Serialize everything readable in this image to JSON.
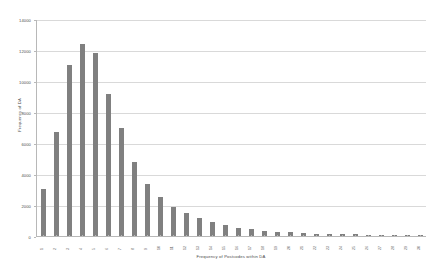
{
  "chart_data": {
    "type": "bar",
    "title": "",
    "xlabel": "Frequency of Postcodes within DA",
    "ylabel": "Frequency of DA",
    "ylim": [
      0,
      14000
    ],
    "ytick_labels": [
      "0",
      "2000",
      "4000",
      "6000",
      "8000",
      "10000",
      "12000",
      "14000"
    ],
    "ytick_values": [
      0,
      2000,
      4000,
      6000,
      8000,
      10000,
      12000,
      14000
    ],
    "grid": true,
    "legend": null,
    "bar_color": "#808080",
    "gridline_color": "#d9d9d9",
    "axis_color": "#b8b8b8",
    "background": "#ffffff",
    "categories": [
      "1",
      "2",
      "3",
      "4",
      "5",
      "6",
      "7",
      "8",
      "9",
      "10",
      "11",
      "12",
      "13",
      "14",
      "15",
      "16",
      "17",
      "18",
      "19",
      "20",
      "21",
      "22",
      "23",
      "24",
      "25",
      "26",
      "27",
      "28",
      "29",
      "30"
    ],
    "values": [
      3050,
      6700,
      11050,
      12400,
      11800,
      9150,
      7000,
      4750,
      3350,
      2500,
      1850,
      1500,
      1150,
      900,
      700,
      520,
      430,
      330,
      280,
      230,
      190,
      160,
      140,
      120,
      105,
      95,
      85,
      75,
      70,
      60
    ]
  }
}
